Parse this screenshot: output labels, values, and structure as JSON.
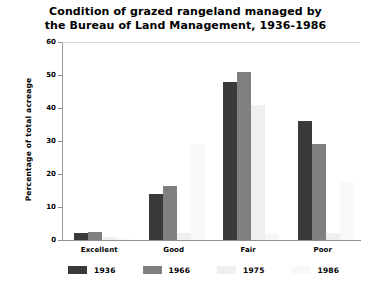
{
  "chart_data": {
    "type": "bar",
    "title": "Condition of grazed rangeland managed by the Bureau of Land Management, 1936-1986",
    "title_line1": "Condition of grazed rangeland managed by",
    "title_line2": "the Bureau of Land Management, 1936-1986",
    "xlabel": "",
    "ylabel": "Percentage of total acreage",
    "ylim": [
      0,
      60
    ],
    "yticks": [
      0,
      10,
      20,
      30,
      40,
      50,
      60
    ],
    "ytick_labels": [
      "0",
      "10",
      "20",
      "30",
      "40",
      "50",
      "60"
    ],
    "categories": [
      "Excellent",
      "Good",
      "Fair",
      "Poor"
    ],
    "grid": true,
    "legend_position": "bottom",
    "series": [
      {
        "name": "1936",
        "color": "#3a3a3a",
        "values": [
          2,
          14,
          48,
          36
        ]
      },
      {
        "name": "1966",
        "color": "#808080",
        "values": [
          2.5,
          16.5,
          51,
          29
        ]
      },
      {
        "name": "1975",
        "color": "#efefef",
        "values": [
          1,
          2,
          41,
          2
        ]
      },
      {
        "name": "1986",
        "color": "#f8f8f8",
        "values": [
          0.5,
          29,
          2,
          17.5
        ]
      }
    ]
  },
  "colors": {
    "background": "#ffffff",
    "axis": "#8f8f8f",
    "grid": "#d9d9d9",
    "text": "#000000"
  }
}
